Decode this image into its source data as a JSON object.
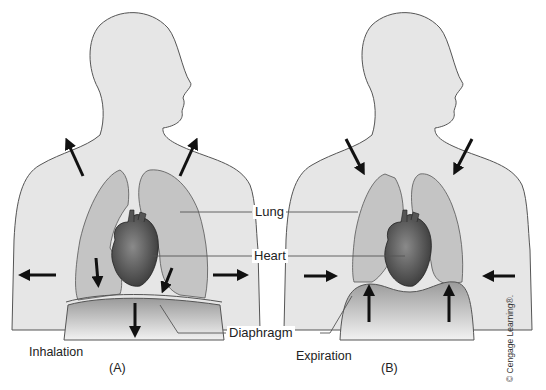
{
  "diagram": {
    "labels": {
      "lung": "Lung",
      "heart": "Heart",
      "diaphragm": "Diaphragm"
    },
    "panels": [
      {
        "id": "A",
        "caption": "Inhalation",
        "letter": "(A)",
        "arrows": "outward/upward rib cage, diaphragm down"
      },
      {
        "id": "B",
        "caption": "Expiration",
        "letter": "(B)",
        "arrows": "inward/downward rib cage, diaphragm up"
      }
    ],
    "copyright": "© Cengage Learning®."
  },
  "colors": {
    "body_fill": "#e6e6e6",
    "outline": "#555555",
    "lung_fill": "#c4c4c4",
    "heart_fill": "#5a5a5a",
    "arrow": "#111111"
  }
}
